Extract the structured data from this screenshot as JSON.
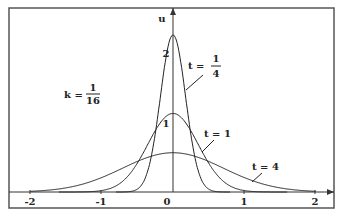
{
  "chart_data": {
    "type": "line",
    "title": "",
    "xlabel": "",
    "ylabel": "u",
    "xlim": [
      -2.2,
      2.3
    ],
    "ylim": [
      0,
      2.4
    ],
    "x_ticks": [
      "-2",
      "-1",
      "0",
      "1",
      "2"
    ],
    "y_ticks": [
      "1",
      "2"
    ],
    "grid": false,
    "annotation": {
      "k": "k = 1/16",
      "k_num": "1",
      "k_den": "16"
    },
    "formula": "u(x,t) = exp(-x^2/(4kt)) / sqrt(4*pi*k*t)",
    "k": 0.0625,
    "series": [
      {
        "name": "t = 1/4",
        "t": 0.25,
        "label_prefix": "t =",
        "label_num": "1",
        "label_den": "4",
        "peak": 2.257
      },
      {
        "name": "t = 1",
        "t": 1,
        "label": "t = 1",
        "peak": 1.128
      },
      {
        "name": "t = 4",
        "t": 4,
        "label": "t = 4",
        "peak": 0.564
      }
    ],
    "colors": {
      "line": "#222222",
      "frame": "#555555"
    }
  }
}
